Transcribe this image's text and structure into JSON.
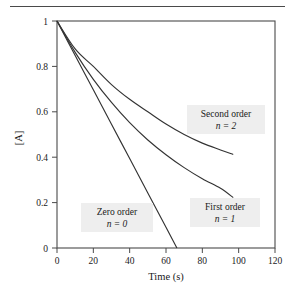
{
  "figure": {
    "has_top_rule": true,
    "background_color": "#ffffff",
    "line_color": "#333333",
    "frame_color": "#4a4a4a",
    "annotation_box_color": "#eeeeee"
  },
  "chart_data": {
    "type": "line",
    "title": "",
    "xlabel": "Time (s)",
    "ylabel": "[A]",
    "xlim": [
      0,
      120
    ],
    "ylim": [
      0,
      1
    ],
    "xticks": [
      0,
      20,
      40,
      60,
      80,
      100,
      120
    ],
    "xtick_labels": [
      "0",
      "20",
      "40",
      "60",
      "80",
      "100",
      "120"
    ],
    "yticks": [
      0,
      0.2,
      0.4,
      0.6,
      0.8,
      1
    ],
    "ytick_labels": [
      "0",
      "0.2",
      "0.4",
      "0.6",
      "0.8",
      "1"
    ],
    "grid": false,
    "legend_position": "inline-annotations",
    "series": [
      {
        "name": "Zero order",
        "order_label": "n = 0",
        "x": [
          0,
          10,
          20,
          30,
          40,
          50,
          60,
          66
        ],
        "values": [
          1.0,
          0.848,
          0.697,
          0.545,
          0.394,
          0.242,
          0.091,
          0.0
        ]
      },
      {
        "name": "First order",
        "order_label": "n = 1",
        "x": [
          0,
          10,
          20,
          30,
          40,
          50,
          60,
          70,
          80,
          90,
          97
        ],
        "values": [
          1.0,
          0.862,
          0.743,
          0.641,
          0.552,
          0.476,
          0.411,
          0.354,
          0.305,
          0.263,
          0.222
        ]
      },
      {
        "name": "Second order",
        "order_label": "n = 2",
        "x": [
          0,
          10,
          20,
          30,
          40,
          50,
          60,
          70,
          80,
          90,
          97
        ],
        "values": [
          1.0,
          0.877,
          0.8,
          0.72,
          0.655,
          0.6,
          0.546,
          0.5,
          0.462,
          0.432,
          0.412
        ]
      }
    ],
    "annotations": [
      {
        "id": "zero-order",
        "line1": "Zero order",
        "line2": "n = 0",
        "x": 30,
        "y": 0.13
      },
      {
        "id": "first-order",
        "line1": "First order",
        "line2": "n = 1",
        "x": 88,
        "y": 0.155
      },
      {
        "id": "second-order",
        "line1": "Second order",
        "line2": "n = 2",
        "x": 88,
        "y": 0.545
      }
    ]
  }
}
